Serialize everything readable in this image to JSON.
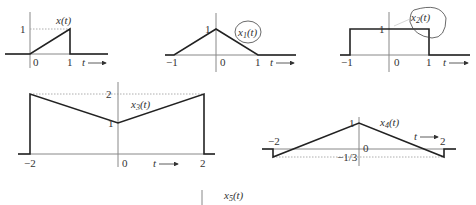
{
  "figure": {
    "graphs": [
      {
        "id": "x",
        "label": "x(t)",
        "ticks_x": [
          "0",
          "1"
        ],
        "ticks_y": [
          "1"
        ],
        "axis_arrow": "t →",
        "points": [
          [
            -1,
            0
          ],
          [
            0,
            0
          ],
          [
            1,
            1
          ],
          [
            1,
            0
          ],
          [
            2,
            0
          ]
        ]
      },
      {
        "id": "x1",
        "label": "x1(t)",
        "sub": "1",
        "ticks_x": [
          "−1",
          "0",
          "1"
        ],
        "ticks_y": [
          "1"
        ],
        "axis_arrow": "t →",
        "points": [
          [
            -1.5,
            0
          ],
          [
            -1,
            0
          ],
          [
            0,
            1
          ],
          [
            1,
            0
          ],
          [
            2,
            0
          ]
        ]
      },
      {
        "id": "x2",
        "label": "x2(t)",
        "sub": "2",
        "ticks_x": [
          "−1",
          "0",
          "1"
        ],
        "ticks_y": [
          "1"
        ],
        "axis_arrow": "t →",
        "points": [
          [
            -1.5,
            0
          ],
          [
            -1,
            0
          ],
          [
            -1,
            1
          ],
          [
            1,
            1
          ],
          [
            1,
            0
          ],
          [
            2,
            0
          ]
        ]
      },
      {
        "id": "x3",
        "label": "x3(t)",
        "sub": "3",
        "ticks_x": [
          "−2",
          "0",
          "2"
        ],
        "ticks_y": [
          "1",
          "2"
        ],
        "axis_arrow": "t →",
        "points": [
          [
            -2.2,
            0
          ],
          [
            -2,
            0
          ],
          [
            -2,
            2
          ],
          [
            0,
            1
          ],
          [
            2,
            2
          ],
          [
            2,
            0
          ],
          [
            2.2,
            0
          ]
        ]
      },
      {
        "id": "x4",
        "label": "x4(t)",
        "sub": "4",
        "ticks_x": [
          "−2",
          "0",
          "2"
        ],
        "ticks_y": [
          "1",
          "−1/3"
        ],
        "axis_arrow": "t →",
        "points": [
          [
            -2.5,
            0
          ],
          [
            -2,
            0
          ],
          [
            -2,
            -0.333
          ],
          [
            0,
            1
          ],
          [
            2,
            -0.333
          ],
          [
            2,
            0
          ],
          [
            2.5,
            0
          ]
        ]
      },
      {
        "id": "x5",
        "label": "x5(t)",
        "sub": "5"
      }
    ]
  },
  "text": {
    "x_label": "x(t)",
    "x1_base": "x",
    "x1_sub": "1",
    "x1_arg": "(t)",
    "x2_base": "x",
    "x2_sub": "2",
    "x2_arg": "(t)",
    "x3_base": "x",
    "x3_sub": "3",
    "x3_arg": "(t)",
    "x4_base": "x",
    "x4_sub": "4",
    "x4_arg": "(t)",
    "x5_base": "x",
    "x5_sub": "5",
    "x5_arg": "(t)",
    "zero": "0",
    "one": "1",
    "two": "2",
    "neg_one": "−1",
    "neg_two": "−2",
    "neg_third": "−1/3",
    "t_arrow": "t"
  }
}
